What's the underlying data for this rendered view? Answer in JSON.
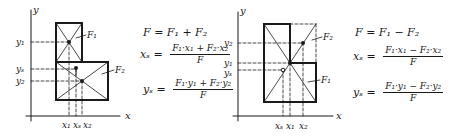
{
  "colors": {
    "ink": "#1a1a1a",
    "background": "#ffffff"
  },
  "left_diagram": {
    "axis_labels": {
      "x": "x",
      "y": "y"
    },
    "y_ticks": [
      "y₁",
      "yₛ",
      "y₂"
    ],
    "x_ticks": [
      "x₁",
      "xₛ",
      "x₂"
    ],
    "area_labels": [
      "F₁",
      "F₂"
    ],
    "formulas": {
      "total": "F = F₁ + F₂",
      "xs_lhs": "xₛ =",
      "xs_num": "F₁·x₁ + F₂·x₂",
      "xs_den": "F",
      "ys_lhs": "yₛ =",
      "ys_num": "F₁·y₁ + F₂·y₂",
      "ys_den": "F"
    }
  },
  "right_diagram": {
    "axis_labels": {
      "x": "x",
      "y": "y"
    },
    "y_ticks": [
      "y₂",
      "y₁",
      "yₛ"
    ],
    "x_ticks": [
      "xₛ",
      "x₁",
      "x₂"
    ],
    "area_labels": [
      "F₂",
      "F₁"
    ],
    "formulas": {
      "total": "F = F₁ − F₂",
      "xs_lhs": "xₛ =",
      "xs_num": "F₁·x₁ − F₂·x₂",
      "xs_den": "F",
      "ys_lhs": "yₛ =",
      "ys_num": "F₁·y₁ − F₂·y₂",
      "ys_den": "F"
    }
  }
}
